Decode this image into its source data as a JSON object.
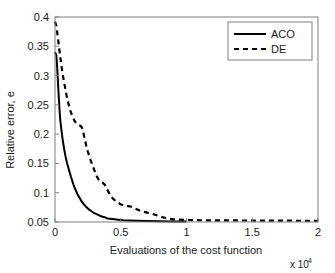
{
  "chart_data": {
    "type": "line",
    "title": "",
    "xlabel": "Evaluations of the cost function",
    "ylabel": "Relative error, e",
    "x_exponent_label": "x 10",
    "x_exponent_power": "4",
    "x_scale_factor": 10000,
    "xlim": [
      0,
      2
    ],
    "ylim": [
      0.05,
      0.4
    ],
    "xticks": [
      "0",
      "0.5",
      "1",
      "1.5",
      "2"
    ],
    "xtick_values": [
      0,
      0.5,
      1,
      1.5,
      2
    ],
    "yticks": [
      "0.05",
      "0.1",
      "0.15",
      "0.2",
      "0.25",
      "0.3",
      "0.35",
      "0.4"
    ],
    "ytick_values": [
      0.05,
      0.1,
      0.15,
      0.2,
      0.25,
      0.3,
      0.35,
      0.4
    ],
    "grid": false,
    "legend_position": "top-right",
    "box": true,
    "series": [
      {
        "name": "ACO",
        "style": "solid",
        "color": "#000000",
        "width": 2.0,
        "points": [
          [
            0.0,
            0.34
          ],
          [
            0.01,
            0.335
          ],
          [
            0.015,
            0.32
          ],
          [
            0.02,
            0.3
          ],
          [
            0.025,
            0.278
          ],
          [
            0.03,
            0.258
          ],
          [
            0.035,
            0.24
          ],
          [
            0.04,
            0.224
          ],
          [
            0.05,
            0.205
          ],
          [
            0.055,
            0.196
          ],
          [
            0.06,
            0.188
          ],
          [
            0.065,
            0.181
          ],
          [
            0.07,
            0.174
          ],
          [
            0.08,
            0.162
          ],
          [
            0.09,
            0.152
          ],
          [
            0.1,
            0.144
          ],
          [
            0.11,
            0.136
          ],
          [
            0.12,
            0.128
          ],
          [
            0.13,
            0.121
          ],
          [
            0.14,
            0.114
          ],
          [
            0.15,
            0.108
          ],
          [
            0.16,
            0.103
          ],
          [
            0.17,
            0.098
          ],
          [
            0.18,
            0.094
          ],
          [
            0.19,
            0.09
          ],
          [
            0.2,
            0.086
          ],
          [
            0.22,
            0.08
          ],
          [
            0.24,
            0.075
          ],
          [
            0.26,
            0.071
          ],
          [
            0.28,
            0.068
          ],
          [
            0.3,
            0.065
          ],
          [
            0.32,
            0.063
          ],
          [
            0.34,
            0.061
          ],
          [
            0.36,
            0.059
          ],
          [
            0.38,
            0.058
          ],
          [
            0.4,
            0.056
          ],
          [
            0.44,
            0.055
          ],
          [
            0.48,
            0.054
          ],
          [
            0.52,
            0.053
          ],
          [
            0.56,
            0.0525
          ],
          [
            0.62,
            0.052
          ],
          [
            0.7,
            0.0515
          ],
          [
            0.8,
            0.0512
          ],
          [
            0.9,
            0.051
          ],
          [
            1.0,
            0.051
          ]
        ]
      },
      {
        "name": "DE",
        "style": "dashed",
        "color": "#000000",
        "width": 2.2,
        "dash": "5,4",
        "points": [
          [
            0.0,
            0.392
          ],
          [
            0.01,
            0.385
          ],
          [
            0.02,
            0.368
          ],
          [
            0.03,
            0.35
          ],
          [
            0.04,
            0.332
          ],
          [
            0.05,
            0.315
          ],
          [
            0.06,
            0.3
          ],
          [
            0.07,
            0.288
          ],
          [
            0.08,
            0.275
          ],
          [
            0.09,
            0.264
          ],
          [
            0.1,
            0.254
          ],
          [
            0.11,
            0.246
          ],
          [
            0.12,
            0.238
          ],
          [
            0.13,
            0.232
          ],
          [
            0.14,
            0.227
          ],
          [
            0.15,
            0.222
          ],
          [
            0.16,
            0.219
          ],
          [
            0.18,
            0.216
          ],
          [
            0.2,
            0.213
          ],
          [
            0.21,
            0.208
          ],
          [
            0.22,
            0.198
          ],
          [
            0.23,
            0.188
          ],
          [
            0.24,
            0.178
          ],
          [
            0.25,
            0.17
          ],
          [
            0.26,
            0.163
          ],
          [
            0.27,
            0.156
          ],
          [
            0.28,
            0.15
          ],
          [
            0.29,
            0.144
          ],
          [
            0.3,
            0.138
          ],
          [
            0.31,
            0.132
          ],
          [
            0.32,
            0.127
          ],
          [
            0.33,
            0.123
          ],
          [
            0.34,
            0.12
          ],
          [
            0.36,
            0.118
          ],
          [
            0.38,
            0.113
          ],
          [
            0.4,
            0.104
          ],
          [
            0.42,
            0.096
          ],
          [
            0.44,
            0.09
          ],
          [
            0.46,
            0.086
          ],
          [
            0.48,
            0.083
          ],
          [
            0.5,
            0.08
          ],
          [
            0.54,
            0.078
          ],
          [
            0.58,
            0.076
          ],
          [
            0.6,
            0.074
          ],
          [
            0.64,
            0.07
          ],
          [
            0.66,
            0.068
          ],
          [
            0.7,
            0.066
          ],
          [
            0.74,
            0.064
          ],
          [
            0.78,
            0.061
          ],
          [
            0.82,
            0.058
          ],
          [
            0.86,
            0.056
          ],
          [
            0.9,
            0.0545
          ],
          [
            0.95,
            0.054
          ],
          [
            1.0,
            0.0535
          ],
          [
            1.1,
            0.053
          ],
          [
            1.25,
            0.0528
          ],
          [
            1.4,
            0.0526
          ],
          [
            1.6,
            0.0524
          ],
          [
            1.8,
            0.0522
          ],
          [
            2.0,
            0.052
          ]
        ]
      }
    ],
    "legend": [
      {
        "label": "ACO",
        "style": "solid"
      },
      {
        "label": "DE",
        "style": "dashed"
      }
    ]
  }
}
